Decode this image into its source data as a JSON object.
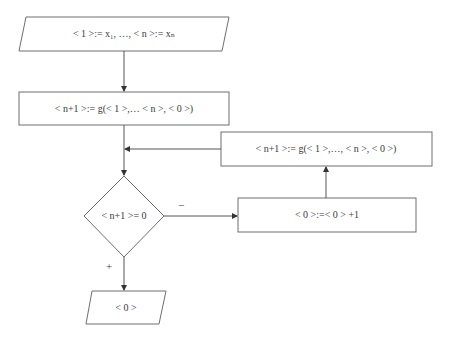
{
  "flowchart": {
    "input": {
      "label": "< 1 >:= x₁, …, < n >:= xₙ",
      "shape": "parallelogram"
    },
    "compute": {
      "label": "< n+1 >:= g(< 1 >,… < n >, < 0 >)",
      "shape": "rectangle"
    },
    "decision": {
      "label": "< n+1 >= 0",
      "shape": "diamond"
    },
    "increment": {
      "label": "< 0 >:=< 0 > +1",
      "shape": "rectangle"
    },
    "recompute": {
      "label": "< n+1 >:= g(< 1 >,…, < n >, < 0 >)",
      "shape": "rectangle"
    },
    "output": {
      "label": "< 0 >",
      "shape": "parallelogram"
    },
    "branches": {
      "no_label": "−",
      "yes_label": "+"
    }
  },
  "colors": {
    "stroke": "#6e6e6e",
    "text": "#3a3a3a",
    "background": "#ffffff"
  }
}
